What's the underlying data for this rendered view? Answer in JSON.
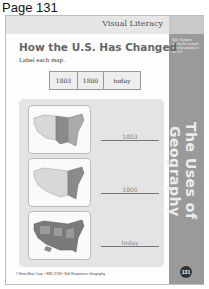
{
  "page_label": "Page 131",
  "header": {
    "section_tag": "Visual Literacy"
  },
  "sidebar": {
    "note": "Note: Students identify the changes in the boundaries of the U.S.",
    "vertical_title": "The Uses of Geography",
    "page_number": "131",
    "color": "#9a9a9a"
  },
  "worksheet": {
    "title": "How the U.S. Has Changed",
    "instruction": "Label each map.",
    "word_bank": [
      "1803",
      "1800",
      "today"
    ],
    "maps": [
      {
        "name": "map-1803",
        "answer": "1803"
      },
      {
        "name": "map-1800",
        "answer": "1800"
      },
      {
        "name": "map-today",
        "answer": "today"
      }
    ]
  },
  "footer": {
    "text": "© Evan-Moor Corp. • EMC 3743 • Skill Sharpeners: Geography"
  }
}
